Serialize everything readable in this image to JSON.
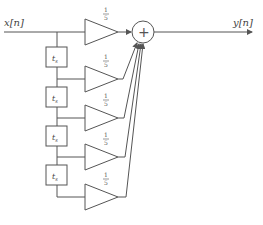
{
  "diagram": {
    "type": "FIR filter (moving average)",
    "input_label": "x[n]",
    "output_label": "y[n]",
    "sum_symbol": "+",
    "delay_label": "t",
    "delay_subscript": "s",
    "gains": [
      {
        "num": "1",
        "den": "5"
      },
      {
        "num": "1",
        "den": "5"
      },
      {
        "num": "1",
        "den": "5"
      },
      {
        "num": "1",
        "den": "5"
      },
      {
        "num": "1",
        "den": "5"
      }
    ],
    "colors": {
      "stroke": "#555555",
      "text": "#444444",
      "background": "#ffffff"
    }
  }
}
